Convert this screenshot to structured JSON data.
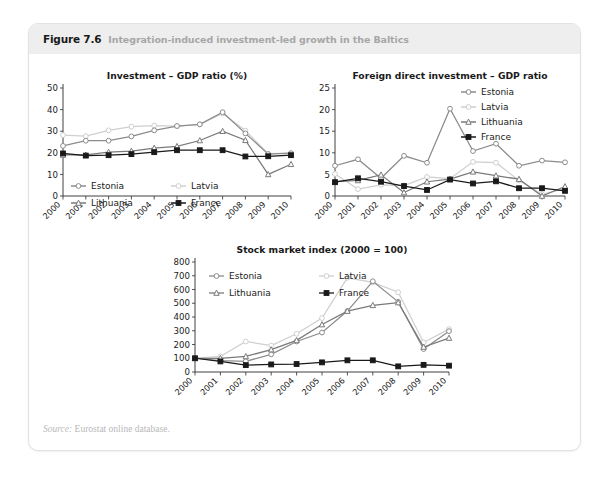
{
  "figure": {
    "number": "Figure 7.6",
    "title": "Integration-induced investment-led growth in the Baltics",
    "watermark": "",
    "source_word": "Source:",
    "source_text": " Eurostat online database."
  },
  "colors": {
    "estonia": "#8c8c8c",
    "latvia": "#cfcfcf",
    "lithuania": "#7a7a7a",
    "france": "#1a1a1a",
    "axis": "#2b2b2b",
    "header_bg": "#eeeeee",
    "frame_border": "#e2e2e2"
  },
  "chart_data": [
    {
      "id": "chart-1",
      "type": "line",
      "title": "Investment – GDP ratio (%)",
      "xlabel": "",
      "ylabel": "",
      "x": [
        "2000",
        "2001",
        "2002",
        "2003",
        "2004",
        "2005",
        "2006",
        "2007",
        "2008",
        "2009",
        "2010"
      ],
      "ylim": [
        0,
        50
      ],
      "yticks": [
        0,
        10,
        20,
        30,
        40,
        50
      ],
      "grid": false,
      "legend_position": "inside-bottom-left",
      "series": [
        {
          "name": "Estonia",
          "marker": "open-circle",
          "color": "#8c8c8c",
          "values": [
            23.2,
            25.6,
            25.6,
            27.6,
            30.4,
            32.4,
            33.2,
            38.8,
            29.0,
            19.4,
            19.8
          ]
        },
        {
          "name": "Latvia",
          "marker": "open-circle",
          "color": "#cfcfcf",
          "values": [
            28.2,
            27.7,
            30.4,
            32.1,
            32.6,
            32.3,
            33.1,
            38.2,
            30.3,
            19.6,
            19.8
          ]
        },
        {
          "name": "Lithuania",
          "marker": "open-triangle",
          "color": "#7a7a7a",
          "values": [
            19.0,
            19.0,
            20.3,
            20.8,
            22.2,
            23.0,
            25.7,
            30.0,
            25.8,
            10.0,
            14.7
          ]
        },
        {
          "name": "France",
          "marker": "solid-square",
          "color": "#1a1a1a",
          "values": [
            19.7,
            18.7,
            18.9,
            19.4,
            20.3,
            21.2,
            21.2,
            21.2,
            18.3,
            18.4,
            18.9
          ]
        }
      ]
    },
    {
      "id": "chart-2",
      "type": "line",
      "title": "Foreign direct investment – GDP ratio",
      "xlabel": "",
      "ylabel": "",
      "x": [
        "2000",
        "2001",
        "2002",
        "2003",
        "2004",
        "2005",
        "2006",
        "2007",
        "2008",
        "2009",
        "2010"
      ],
      "ylim": [
        0,
        25
      ],
      "yticks": [
        0,
        5,
        10,
        15,
        20,
        25
      ],
      "grid": false,
      "legend_position": "top-right",
      "series": [
        {
          "name": "Estonia",
          "marker": "open-circle",
          "color": "#8c8c8c",
          "values": [
            7.0,
            8.5,
            4.1,
            9.3,
            7.7,
            20.2,
            10.4,
            12.1,
            7.0,
            8.2,
            7.8
          ]
        },
        {
          "name": "Latvia",
          "marker": "open-circle",
          "color": "#cfcfcf",
          "values": [
            5.1,
            1.6,
            2.6,
            2.4,
            4.4,
            4.0,
            7.9,
            7.7,
            3.6,
            0.4,
            1.7
          ]
        },
        {
          "name": "Lithuania",
          "marker": "open-triangle",
          "color": "#7a7a7a",
          "values": [
            3.3,
            3.6,
            4.9,
            0.8,
            3.3,
            3.9,
            5.6,
            4.7,
            3.9,
            0.0,
            2.2
          ]
        },
        {
          "name": "France",
          "marker": "solid-square",
          "color": "#1a1a1a",
          "values": [
            3.2,
            4.1,
            3.3,
            2.3,
            1.4,
            3.8,
            2.9,
            3.4,
            1.8,
            1.8,
            1.2
          ]
        }
      ]
    },
    {
      "id": "chart-3",
      "type": "line",
      "title": "Stock market index (2000 = 100)",
      "xlabel": "",
      "ylabel": "",
      "x": [
        "2000",
        "2001",
        "2002",
        "2003",
        "2004",
        "2005",
        "2006",
        "2007",
        "2008",
        "2009",
        "2010"
      ],
      "ylim": [
        0,
        800
      ],
      "yticks": [
        0,
        100,
        200,
        300,
        400,
        500,
        600,
        700,
        800
      ],
      "grid": false,
      "legend_position": "inside-top-left",
      "series": [
        {
          "name": "Estonia",
          "marker": "open-circle",
          "color": "#8c8c8c",
          "values": [
            100,
            82,
            78,
            128,
            222,
            287,
            443,
            660,
            510,
            167,
            297
          ]
        },
        {
          "name": "Latvia",
          "marker": "open-circle",
          "color": "#cfcfcf",
          "values": [
            100,
            113,
            222,
            192,
            278,
            392,
            685,
            652,
            580,
            215,
            312
          ]
        },
        {
          "name": "Lithuania",
          "marker": "open-triangle",
          "color": "#7a7a7a",
          "values": [
            100,
            100,
            113,
            163,
            230,
            345,
            443,
            485,
            505,
            182,
            247
          ]
        },
        {
          "name": "France",
          "marker": "solid-square",
          "color": "#1a1a1a",
          "values": [
            100,
            77,
            50,
            55,
            58,
            70,
            85,
            85,
            41,
            52,
            46
          ]
        }
      ]
    }
  ]
}
